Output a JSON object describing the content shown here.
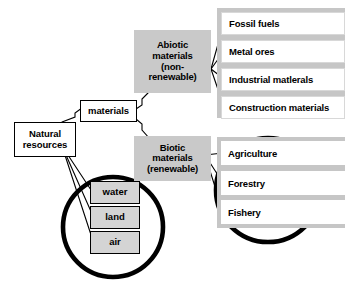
{
  "diagram": {
    "colors": {
      "category_fill": "#c9c9c9",
      "panel_fill": "#c6c6c6",
      "row_fill": "#ffffff",
      "small_box_fill": "#d4d4d4",
      "stroke": "#000000"
    }
  },
  "nodes": {
    "root": {
      "label": "Natural\nresources"
    },
    "materials": {
      "label": "materials"
    },
    "abiotic": {
      "label": "Abiotic\nmaterials\n(non-\nrenewable)"
    },
    "biotic": {
      "label": "Biotic\nmaterials\n(renewable)"
    }
  },
  "abiotic_items": [
    {
      "label": "Fossil fuels"
    },
    {
      "label": "Metal ores"
    },
    {
      "label": "Industrial matlerals"
    },
    {
      "label": "Construction materials"
    }
  ],
  "biotic_items": [
    {
      "label": "Agriculture"
    },
    {
      "label": "Forestry"
    },
    {
      "label": "Fishery"
    }
  ],
  "environment_items": [
    {
      "label": "water"
    },
    {
      "label": "land"
    },
    {
      "label": "air"
    }
  ],
  "highlights": [
    {
      "name": "environment-highlight-circle"
    },
    {
      "name": "biotic-highlight-circle"
    }
  ]
}
